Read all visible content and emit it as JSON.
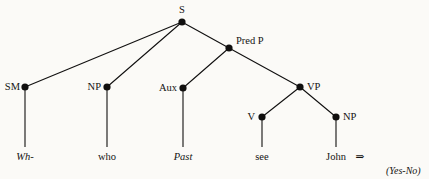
{
  "figure": {
    "type": "syntactic-tree-diagram",
    "background_color": "#fbfaf7",
    "ink_color": "#111010"
  },
  "nodes": {
    "s": {
      "label": "S",
      "x": 182,
      "y": 22,
      "label_x": 182,
      "label_y": 13,
      "label_anchor": "middle"
    },
    "qsm": {
      "label": "SM",
      "x": 25,
      "y": 87,
      "label_x": 20,
      "label_y": 90,
      "label_anchor": "end"
    },
    "np_subject": {
      "label": "NP",
      "x": 107,
      "y": 87,
      "label_x": 101,
      "label_y": 90,
      "label_anchor": "end"
    },
    "pred_p": {
      "label": "Pred P",
      "x": 229,
      "y": 48,
      "label_x": 236,
      "label_y": 44,
      "label_anchor": "start"
    },
    "aux": {
      "label": "Aux",
      "x": 183,
      "y": 88,
      "label_x": 177,
      "label_y": 91,
      "label_anchor": "end"
    },
    "vp": {
      "label": "VP",
      "x": 300,
      "y": 87,
      "label_x": 307,
      "label_y": 90,
      "label_anchor": "start"
    },
    "v": {
      "label": "V",
      "x": 262,
      "y": 117,
      "label_x": 255,
      "label_y": 120,
      "label_anchor": "end"
    },
    "np_object": {
      "label": "NP",
      "x": 336,
      "y": 117,
      "label_x": 343,
      "label_y": 120,
      "label_anchor": "start"
    }
  },
  "branches": [
    {
      "name": "s-to-qsm",
      "x1": 182,
      "y1": 22,
      "x2": 25,
      "y2": 87
    },
    {
      "name": "s-to-np-subject",
      "x1": 182,
      "y1": 22,
      "x2": 107,
      "y2": 87
    },
    {
      "name": "s-to-pred-p",
      "x1": 182,
      "y1": 22,
      "x2": 229,
      "y2": 48
    },
    {
      "name": "pred-p-to-aux",
      "x1": 229,
      "y1": 48,
      "x2": 183,
      "y2": 88
    },
    {
      "name": "pred-p-to-vp",
      "x1": 229,
      "y1": 48,
      "x2": 300,
      "y2": 87
    },
    {
      "name": "vp-to-v",
      "x1": 300,
      "y1": 87,
      "x2": 262,
      "y2": 117
    },
    {
      "name": "vp-to-np-object",
      "x1": 300,
      "y1": 87,
      "x2": 336,
      "y2": 117
    }
  ],
  "terminals": [
    {
      "name": "wh",
      "text": "Wh-",
      "italic": true,
      "node_x": 25,
      "node_y": 87,
      "text_x": 25,
      "text_y": 160,
      "line_bottom": 147
    },
    {
      "name": "who",
      "text": "who",
      "italic": false,
      "node_x": 107,
      "node_y": 87,
      "text_x": 107,
      "text_y": 160,
      "line_bottom": 147
    },
    {
      "name": "past",
      "text": "Past",
      "italic": true,
      "node_x": 183,
      "node_y": 88,
      "text_x": 183,
      "text_y": 160,
      "line_bottom": 147
    },
    {
      "name": "see",
      "text": "see",
      "italic": false,
      "node_x": 262,
      "node_y": 117,
      "text_x": 262,
      "text_y": 160,
      "line_bottom": 147
    },
    {
      "name": "john",
      "text": "John",
      "italic": false,
      "node_x": 336,
      "node_y": 117,
      "text_x": 336,
      "text_y": 160,
      "line_bottom": 147
    }
  ],
  "annotations": {
    "derivation_arrow": {
      "glyph": "⇒",
      "x": 360,
      "y": 160
    },
    "yes_no": {
      "text": "(Yes-No)",
      "x": 386,
      "y": 174
    }
  }
}
